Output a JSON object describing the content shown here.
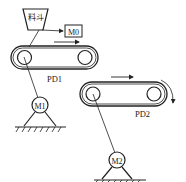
{
  "diagram": {
    "hopper_label": "料斗",
    "motor0_label": "M0",
    "conveyor1_label": "PD1",
    "conveyor2_label": "PD2",
    "motor1_label": "M1",
    "motor2_label": "M2",
    "line_color": "#222222"
  }
}
